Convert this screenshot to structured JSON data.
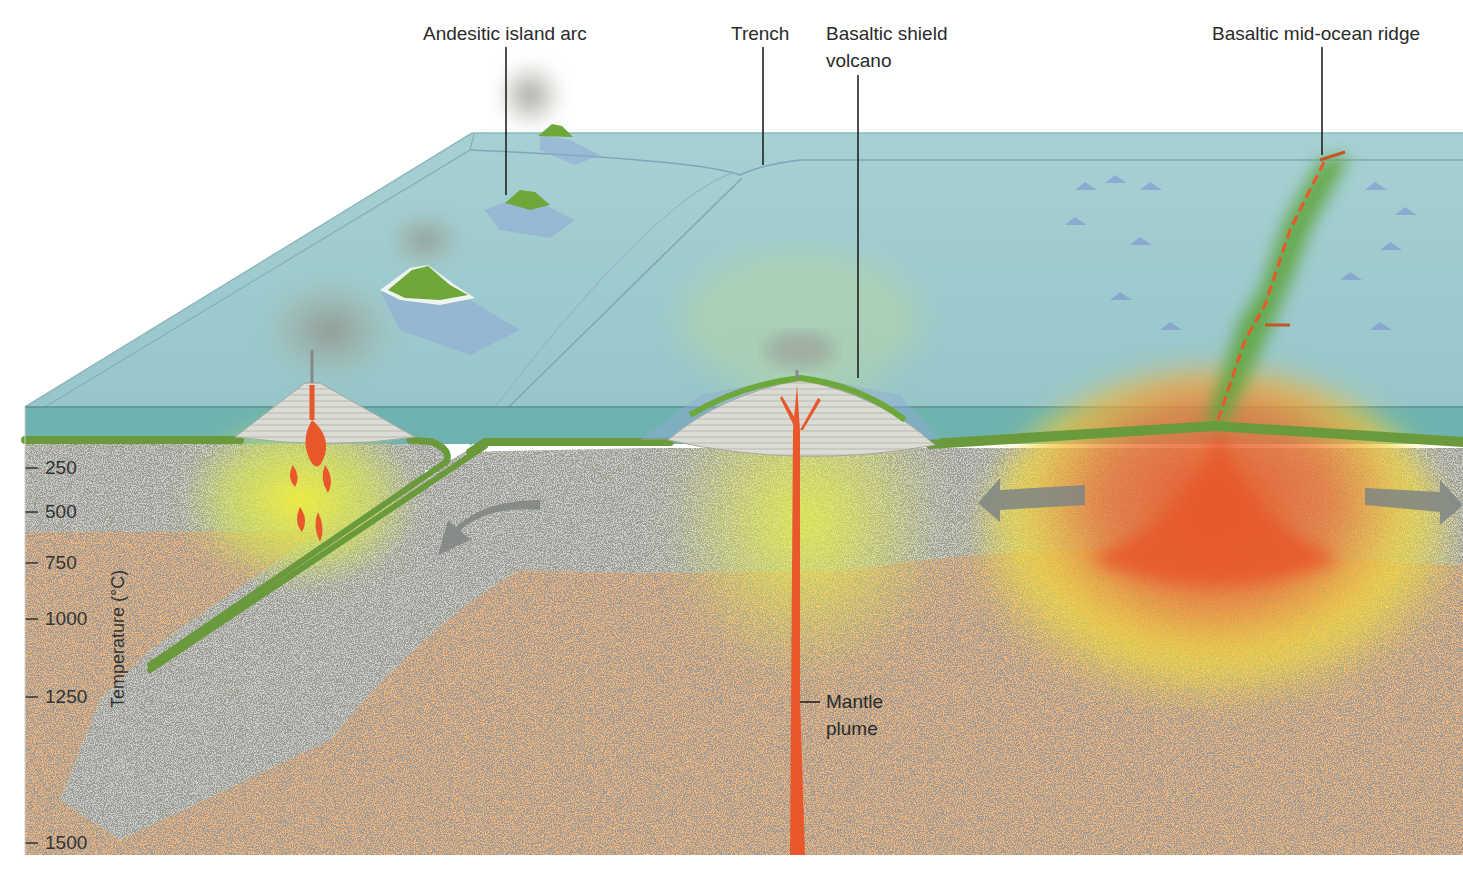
{
  "labels": {
    "andesitic_island_arc": "Andesitic island arc",
    "trench": "Trench",
    "basaltic_shield_volcano_line1": "Basaltic shield",
    "basaltic_shield_volcano_line2": "volcano",
    "basaltic_mid_ocean_ridge": "Basaltic mid-ocean ridge",
    "mantle_plume_line1": "Mantle",
    "mantle_plume_line2": "plume"
  },
  "temperature_axis": {
    "title": "Temperature (°C)",
    "ticks": [
      "250",
      "500",
      "750",
      "1000",
      "1250",
      "1500"
    ]
  },
  "colors": {
    "ocean_surface": "#9fcbd0",
    "ocean_front": "#6fb3b0",
    "oceanic_crust": "#6a9a3c",
    "lithosphere": "#c5cfc8",
    "asthenosphere": "#f2b77c",
    "magma": "#e8582a",
    "heat_glow": "#f5e53a",
    "arrow": "#7f8582",
    "volcano_green": "#6ea83a",
    "volcano_cone": "#d9d9d3",
    "ash": "#9a9a95"
  }
}
